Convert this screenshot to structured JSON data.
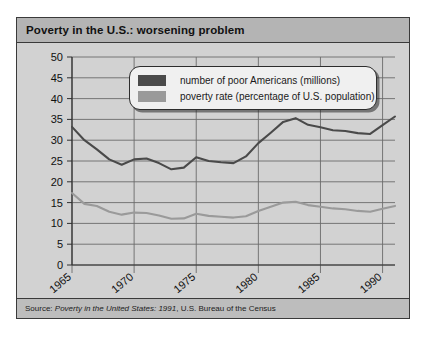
{
  "figure": {
    "title": "Poverty in the U.S.: worsening problem",
    "source_prefix": "Source: ",
    "source_italic": "Poverty in the United States: 1991",
    "source_suffix": ", U.S. Bureau of the Census"
  },
  "legend": {
    "items": [
      {
        "label": "number of poor Americans (millions)",
        "color": "#4a4a4a"
      },
      {
        "label": "poverty rate (percentage of U.S. population)",
        "color": "#9a9a9a"
      }
    ]
  },
  "colors": {
    "panel_background": "#d2d2d2",
    "title_background": "#b4b4b4",
    "source_background": "#bdbdbd",
    "frame": "#3a3a3a",
    "grid": "#6b6b6b",
    "axis": "#303030",
    "series_dark": "#4a4a4a",
    "series_light": "#9a9a9a"
  },
  "chart_data": {
    "type": "line",
    "title": "Poverty in the U.S.: worsening problem",
    "xlabel": "",
    "ylabel": "",
    "xlim": [
      1965,
      1991
    ],
    "ylim": [
      0,
      50
    ],
    "ytick_values": [
      0,
      5,
      10,
      15,
      20,
      25,
      30,
      35,
      40,
      45,
      50
    ],
    "ytick_labels": [
      "0",
      "5",
      "10",
      "15",
      "20",
      "25",
      "30",
      "35",
      "40",
      "45",
      "50"
    ],
    "xtick_values": [
      1965,
      1970,
      1975,
      1980,
      1985,
      1990
    ],
    "xtick_labels": [
      "1965",
      "1970",
      "1975",
      "1980",
      "1985",
      "1990"
    ],
    "xtick_rotation": 40,
    "grid": "both",
    "legend_position": "top-center",
    "x": [
      1965,
      1966,
      1967,
      1968,
      1969,
      1970,
      1971,
      1972,
      1973,
      1974,
      1975,
      1976,
      1977,
      1978,
      1979,
      1980,
      1981,
      1982,
      1983,
      1984,
      1985,
      1986,
      1987,
      1988,
      1989,
      1990,
      1991
    ],
    "series": [
      {
        "name": "number of poor Americans (millions)",
        "color": "#4a4a4a",
        "unit": "millions",
        "values": [
          33.2,
          30.0,
          27.8,
          25.4,
          24.1,
          25.4,
          25.6,
          24.5,
          23.0,
          23.4,
          25.9,
          25.0,
          24.7,
          24.5,
          26.1,
          29.3,
          31.8,
          34.4,
          35.3,
          33.7,
          33.1,
          32.4,
          32.2,
          31.7,
          31.5,
          33.6,
          35.7
        ]
      },
      {
        "name": "poverty rate (percentage of U.S. population)",
        "color": "#9a9a9a",
        "unit": "percent",
        "values": [
          17.3,
          14.7,
          14.2,
          12.8,
          12.1,
          12.6,
          12.5,
          11.9,
          11.1,
          11.2,
          12.3,
          11.8,
          11.6,
          11.4,
          11.7,
          13.0,
          14.0,
          15.0,
          15.2,
          14.4,
          14.0,
          13.6,
          13.4,
          13.0,
          12.8,
          13.5,
          14.2
        ]
      }
    ]
  }
}
